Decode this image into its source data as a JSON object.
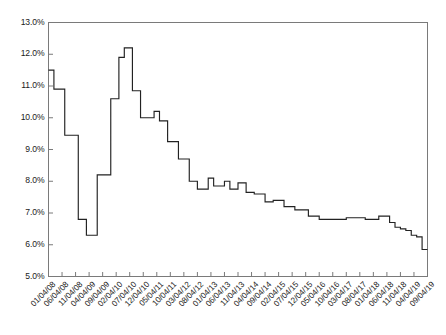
{
  "chart_data": {
    "type": "line",
    "line_style": "step",
    "title": "",
    "subtitle": "",
    "xlabel": "",
    "ylabel": "",
    "ylim": [
      5.0,
      13.0
    ],
    "ytick_labels": [
      "13.0%",
      "12.0%",
      "11.0%",
      "10.0%",
      "9.0%",
      "8.0%",
      "7.0%",
      "6.0%",
      "5.0%"
    ],
    "ytick_values": [
      13.0,
      12.0,
      11.0,
      10.0,
      9.0,
      8.0,
      7.0,
      6.0,
      5.0
    ],
    "grid": false,
    "legend": "none",
    "series_name": "rate",
    "line_color": "#222222",
    "frame_color": "#7a7a7a",
    "xtick_labels": [
      "01/04/08",
      "06/04/08",
      "11/04/08",
      "04/04/09",
      "09/04/09",
      "02/04/10",
      "07/04/10",
      "12/04/10",
      "05/04/11",
      "10/04/11",
      "03/04/12",
      "08/04/12",
      "01/04/13",
      "06/04/13",
      "11/04/13",
      "04/04/14",
      "09/04/14",
      "02/04/15",
      "07/04/15",
      "12/04/15",
      "05/04/16",
      "10/04/16",
      "03/04/17",
      "08/04/17",
      "01/04/18",
      "06/04/18",
      "11/04/18",
      "04/04/19",
      "09/04/19"
    ],
    "x": [
      "01/04/08",
      "02/04/08",
      "03/04/08",
      "04/04/08",
      "05/04/08",
      "06/04/08",
      "07/04/08",
      "08/04/08",
      "09/04/08",
      "10/04/08",
      "11/04/08",
      "12/04/08",
      "01/04/09",
      "02/04/09",
      "03/04/09",
      "04/04/09",
      "05/04/09",
      "06/04/09",
      "07/04/09",
      "08/04/09",
      "09/04/09",
      "10/04/09",
      "11/04/09",
      "12/04/09",
      "01/04/10",
      "02/04/10",
      "03/04/10",
      "04/04/10",
      "05/04/10",
      "06/04/10",
      "07/04/10",
      "08/04/10",
      "09/04/10",
      "10/04/10",
      "11/04/10",
      "12/04/10",
      "01/04/11",
      "02/04/11",
      "03/04/11",
      "04/04/11",
      "05/04/11",
      "06/04/11",
      "07/04/11",
      "08/04/11",
      "09/04/11",
      "10/04/11",
      "11/04/11",
      "12/04/11",
      "01/04/12",
      "02/04/12",
      "03/04/12",
      "04/04/12",
      "05/04/12",
      "06/04/12",
      "07/04/12",
      "08/04/12",
      "09/04/12",
      "10/04/12",
      "11/04/12",
      "12/04/12",
      "01/04/13",
      "02/04/13",
      "03/04/13",
      "04/04/13",
      "05/04/13",
      "06/04/13",
      "07/04/13",
      "08/04/13",
      "09/04/13",
      "10/04/13",
      "11/04/13",
      "12/04/13",
      "01/04/14",
      "02/04/14",
      "03/04/14",
      "04/04/14",
      "05/04/14",
      "06/04/14",
      "07/04/14",
      "08/04/14",
      "09/04/14",
      "10/04/14",
      "11/04/14",
      "12/04/14",
      "01/04/15",
      "02/04/15",
      "03/04/15",
      "04/04/15",
      "05/04/15",
      "06/04/15",
      "07/04/15",
      "08/04/15",
      "09/04/15",
      "10/04/15",
      "11/04/15",
      "12/04/15",
      "01/04/16",
      "02/04/16",
      "03/04/16",
      "04/04/16",
      "05/04/16",
      "06/04/16",
      "07/04/16",
      "08/04/16",
      "09/04/16",
      "10/04/16",
      "11/04/16",
      "12/04/16",
      "01/04/17",
      "02/04/17",
      "03/04/17",
      "04/04/17",
      "05/04/17",
      "06/04/17",
      "07/04/17",
      "08/04/17",
      "09/04/17",
      "10/04/17",
      "11/04/17",
      "12/04/17",
      "01/04/18",
      "02/04/18",
      "03/04/18",
      "04/04/18",
      "05/04/18",
      "06/04/18",
      "07/04/18",
      "08/04/18",
      "09/04/18",
      "10/04/18",
      "11/04/18",
      "12/04/18",
      "01/04/19",
      "02/04/19",
      "03/04/19",
      "04/04/19",
      "05/04/19",
      "06/04/19",
      "07/04/19",
      "08/04/19",
      "09/04/19"
    ],
    "values": [
      11.5,
      11.5,
      10.9,
      10.9,
      10.9,
      10.9,
      9.45,
      9.45,
      9.45,
      9.45,
      9.45,
      6.8,
      6.8,
      6.8,
      6.3,
      6.3,
      6.3,
      6.3,
      8.2,
      8.2,
      8.2,
      8.2,
      8.2,
      10.6,
      10.6,
      10.6,
      11.9,
      11.9,
      12.2,
      12.2,
      12.2,
      10.85,
      10.85,
      10.85,
      10.0,
      10.0,
      10.0,
      10.0,
      10.0,
      10.2,
      10.2,
      9.9,
      9.9,
      9.9,
      9.25,
      9.25,
      9.25,
      9.25,
      8.7,
      8.7,
      8.7,
      8.7,
      8.0,
      8.0,
      8.0,
      7.75,
      7.75,
      7.75,
      7.75,
      8.1,
      8.1,
      7.85,
      7.85,
      7.85,
      7.85,
      8.0,
      8.0,
      7.75,
      7.75,
      7.75,
      7.95,
      7.95,
      7.95,
      7.65,
      7.65,
      7.65,
      7.6,
      7.6,
      7.6,
      7.6,
      7.35,
      7.35,
      7.35,
      7.4,
      7.4,
      7.4,
      7.4,
      7.2,
      7.2,
      7.2,
      7.2,
      7.1,
      7.1,
      7.1,
      7.1,
      7.1,
      6.9,
      6.9,
      6.9,
      6.9,
      6.8,
      6.8,
      6.8,
      6.8,
      6.8,
      6.8,
      6.8,
      6.8,
      6.8,
      6.8,
      6.85,
      6.85,
      6.85,
      6.85,
      6.85,
      6.85,
      6.85,
      6.8,
      6.8,
      6.8,
      6.8,
      6.8,
      6.9,
      6.9,
      6.9,
      6.9,
      6.7,
      6.7,
      6.55,
      6.55,
      6.5,
      6.5,
      6.45,
      6.45,
      6.3,
      6.3,
      6.25,
      6.25,
      5.85,
      5.85,
      5.85
    ]
  }
}
